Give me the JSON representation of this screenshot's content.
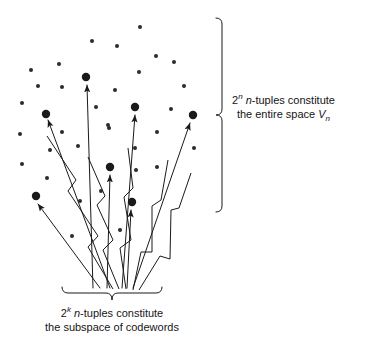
{
  "figure": {
    "background_color": "#ffffff",
    "ink_color": "#1a1a1a",
    "dot_color": "#2b2b2b"
  },
  "annotations": {
    "space_brace": {
      "line1_prefix": "2",
      "line1_exponent": "n",
      "line1_mid": " ",
      "line1_var": "n",
      "line1_rest": "-tuples constitute",
      "line2_prefix": "the entire space ",
      "line2_var": "V",
      "line2_sub": "n"
    },
    "subspace_brace": {
      "line1_prefix": "2",
      "line1_exponent": "k",
      "line1_mid": " ",
      "line1_var": "n",
      "line1_rest": "-tuples constitute",
      "line2": "the subspace of codewords"
    }
  },
  "chart_data": {
    "type": "scatter",
    "xlabel": "",
    "ylabel": "",
    "grid": false,
    "legend": "none",
    "xlim": [
      0,
      220
    ],
    "ylim": [
      0,
      300
    ],
    "series": [
      {
        "name": "small-dots",
        "marker": "small-dot",
        "radius": 2.0,
        "color": "#2b2b2b",
        "points": [
          [
            140,
            27
          ],
          [
            92,
            41
          ],
          [
            117,
            46
          ],
          [
            59,
            64
          ],
          [
            156,
            56
          ],
          [
            31,
            70
          ],
          [
            174,
            62
          ],
          [
            38,
            86
          ],
          [
            139,
            72
          ],
          [
            115,
            90
          ],
          [
            22,
            103
          ],
          [
            62,
            87
          ],
          [
            184,
            86
          ],
          [
            96,
            107
          ],
          [
            171,
            109
          ],
          [
            20,
            134
          ],
          [
            62,
            132
          ],
          [
            109,
            128
          ],
          [
            78,
            146
          ],
          [
            135,
            148
          ],
          [
            191,
            115
          ],
          [
            50,
            150
          ],
          [
            194,
            148
          ],
          [
            108,
            125
          ],
          [
            157,
            132
          ],
          [
            22,
            164
          ],
          [
            136,
            170
          ],
          [
            80,
            201
          ],
          [
            101,
            191
          ],
          [
            157,
            167
          ],
          [
            72,
            236
          ],
          [
            120,
            230
          ],
          [
            47,
            178
          ]
        ]
      },
      {
        "name": "codeword-dots",
        "marker": "large-dot",
        "radius": 4.2,
        "color": "#1a1a1a",
        "points": [
          [
            86,
            77
          ],
          [
            46,
            114
          ],
          [
            135,
            107
          ],
          [
            193,
            115
          ],
          [
            110,
            167
          ],
          [
            36,
            196
          ],
          [
            132,
            202
          ]
        ]
      }
    ],
    "arrows": [
      {
        "name": "arrow-to-dot-1",
        "from": [
          110,
          288
        ],
        "to": [
          48,
          120
        ],
        "head": "filled"
      },
      {
        "name": "arrow-to-dot-2",
        "from": [
          93,
          288
        ],
        "to": [
          87,
          85
        ],
        "head": "filled"
      },
      {
        "name": "arrow-to-dot-3",
        "from": [
          107,
          288
        ],
        "to": [
          110,
          175
        ],
        "head": "filled"
      },
      {
        "name": "arrow-to-dot-4",
        "from": [
          122,
          288
        ],
        "to": [
          135,
          115
        ],
        "head": "filled"
      },
      {
        "name": "arrow-to-dot-5",
        "from": [
          127,
          288
        ],
        "to": [
          131,
          210
        ],
        "head": "filled"
      },
      {
        "name": "arrow-to-dot-6",
        "from": [
          133,
          288
        ],
        "to": [
          190,
          123
        ],
        "head": "filled"
      },
      {
        "name": "arrow-to-dot-7",
        "from": [
          100,
          288
        ],
        "to": [
          38,
          204
        ],
        "head": "filled"
      }
    ],
    "zigzags": [
      {
        "name": "zigzag-1",
        "points": [
          [
            113,
            289
          ],
          [
            88,
            247
          ],
          [
            98,
            236
          ],
          [
            68,
            191
          ],
          [
            76,
            180
          ],
          [
            47,
            136
          ]
        ]
      },
      {
        "name": "zigzag-2",
        "points": [
          [
            119,
            289
          ],
          [
            103,
            250
          ],
          [
            113,
            240
          ],
          [
            97,
            205
          ],
          [
            105,
            196
          ],
          [
            88,
            157
          ]
        ]
      },
      {
        "name": "zigzag-3",
        "points": [
          [
            126,
            289
          ],
          [
            120,
            248
          ],
          [
            131,
            240
          ],
          [
            124,
            197
          ],
          [
            133,
            188
          ],
          [
            128,
            148
          ]
        ]
      },
      {
        "name": "zigzag-4",
        "points": [
          [
            133,
            290
          ],
          [
            141,
            252
          ],
          [
            152,
            252
          ],
          [
            152,
            206
          ],
          [
            161,
            200
          ],
          [
            168,
            160
          ]
        ]
      },
      {
        "name": "zigzag-5",
        "points": [
          [
            139,
            290
          ],
          [
            160,
            256
          ],
          [
            170,
            259
          ],
          [
            171,
            210
          ],
          [
            179,
            208
          ],
          [
            191,
            173
          ]
        ]
      }
    ],
    "braces": [
      {
        "name": "vertical-brace-space",
        "orientation": "vertical",
        "x": 222,
        "y1": 18,
        "y2": 212,
        "tip_x": 216
      },
      {
        "name": "horizontal-brace-subspace",
        "orientation": "horizontal",
        "y": 293,
        "x1": 62,
        "x2": 162,
        "tip_y": 300
      }
    ]
  }
}
